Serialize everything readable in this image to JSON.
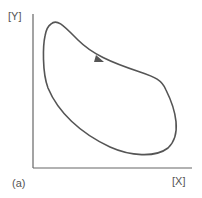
{
  "diagram": {
    "y_axis_label": "[Y]",
    "x_axis_label": "[X]",
    "panel_label": "(a)",
    "line_color": "#555555",
    "curve": "closed loop trajectory with clockwise direction arrow"
  }
}
